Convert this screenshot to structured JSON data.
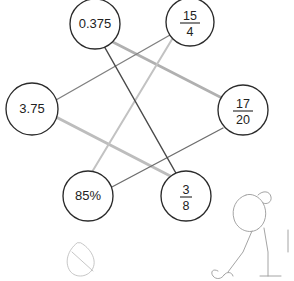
{
  "canvas": {
    "width": 294,
    "height": 281,
    "background_color": "#ffffff",
    "title": "Matching diagram: equivalent numbers"
  },
  "nodes": [
    {
      "id": "node-0375",
      "name": "node-0-375",
      "label": "0.375",
      "kind": "decimal",
      "cx": 95,
      "cy": 24,
      "r": 25
    },
    {
      "id": "node-15-4",
      "name": "node-15-over-4",
      "label": "15/4",
      "numerator": "15",
      "denominator": "4",
      "kind": "fraction",
      "cx": 190,
      "cy": 22,
      "r": 24
    },
    {
      "id": "node-375",
      "name": "node-3-75",
      "label": "3.75",
      "kind": "decimal",
      "cx": 32,
      "cy": 109,
      "r": 26
    },
    {
      "id": "node-17-20",
      "name": "node-17-over-20",
      "label": "17/20",
      "numerator": "17",
      "denominator": "20",
      "kind": "fraction",
      "cx": 243,
      "cy": 110,
      "r": 25
    },
    {
      "id": "node-85pct",
      "name": "node-85-percent",
      "label": "85%",
      "kind": "percent",
      "cx": 88,
      "cy": 196,
      "r": 25
    },
    {
      "id": "node-3-8",
      "name": "node-3-over-8",
      "label": "3/8",
      "numerator": "3",
      "denominator": "8",
      "kind": "fraction",
      "cx": 186,
      "cy": 196,
      "r": 25
    }
  ],
  "edges": [
    {
      "id": "edge-0375-38",
      "name": "edge-0-375-to-3-8",
      "from": "0.375",
      "to": "3/8",
      "x1": 104,
      "y1": 46,
      "x2": 177,
      "y2": 175,
      "color": "#4a4a4a",
      "width": 1.5
    },
    {
      "id": "edge-0375-1720",
      "name": "edge-0-375-to-17-over-20",
      "from": "0.375",
      "to": "17/20",
      "x1": 105,
      "y1": 38,
      "x2": 222,
      "y2": 98,
      "color": "#b0b0b0",
      "width": 2.6
    },
    {
      "id": "edge-154-85",
      "name": "edge-15-over-4-to-85-percent",
      "from": "15/4",
      "to": "85%",
      "x1": 174,
      "y1": 36,
      "x2": 92,
      "y2": 172,
      "color": "#c2c2c2",
      "width": 2.0
    },
    {
      "id": "edge-375-154",
      "name": "edge-3-75-to-15-over-4",
      "from": "3.75",
      "to": "15/4",
      "x1": 56,
      "y1": 100,
      "x2": 170,
      "y2": 35,
      "color": "#808080",
      "width": 1.4
    },
    {
      "id": "edge-375-38",
      "name": "edge-3-75-to-3-8",
      "from": "3.75",
      "to": "3/8",
      "x1": 56,
      "y1": 117,
      "x2": 178,
      "y2": 180,
      "color": "#bdbdbd",
      "width": 3.0
    },
    {
      "id": "edge-85-1720",
      "name": "edge-85-percent-to-17-over-20",
      "from": "85%",
      "to": "17/20",
      "x1": 110,
      "y1": 188,
      "x2": 223,
      "y2": 128,
      "color": "#6e6e6e",
      "width": 1.4
    }
  ],
  "doodles": [
    {
      "id": "doodle-leaf",
      "name": "doodle-leaf-loop",
      "description": "faint pencil leaf loop"
    },
    {
      "id": "doodle-figure",
      "name": "doodle-stick-figure",
      "description": "faint pencil stick figure sketch"
    }
  ]
}
